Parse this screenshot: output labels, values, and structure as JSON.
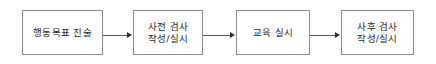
{
  "diagram": {
    "title": "",
    "orientation": "horizontal",
    "background_color": "#ffffff",
    "box_border_color": "#8a8a8a",
    "arrow_color": "#555555",
    "text_color": "#1d1d1d",
    "nodes": [
      {
        "id": "node-1",
        "lines": [
          "행동목표 진술"
        ]
      },
      {
        "id": "node-2",
        "lines": [
          "사전 검사",
          "작성/실시"
        ]
      },
      {
        "id": "node-3",
        "lines": [
          "교육 실시"
        ]
      },
      {
        "id": "node-4",
        "lines": [
          "사후 검사",
          "작성/실시"
        ]
      }
    ],
    "connectors": [
      {
        "id": "connector-1",
        "from": "node-1",
        "to": "node-2",
        "icon": "arrow-right-icon"
      },
      {
        "id": "connector-2",
        "from": "node-2",
        "to": "node-3",
        "icon": "arrow-right-icon"
      },
      {
        "id": "connector-3",
        "from": "node-3",
        "to": "node-4",
        "icon": "arrow-right-icon"
      }
    ]
  }
}
